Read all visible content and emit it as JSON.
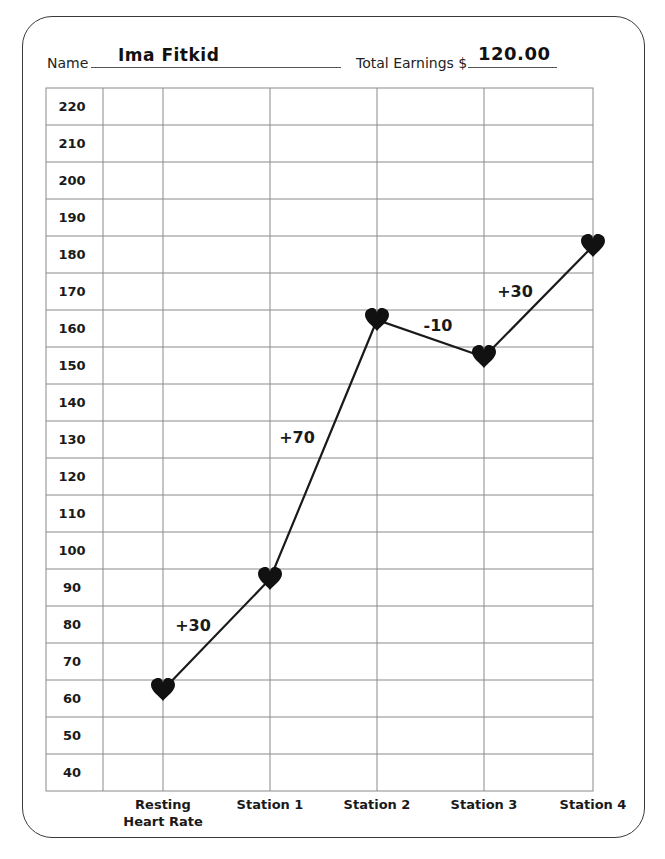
{
  "header": {
    "name_label": "Name",
    "name_value": "Ima Fitkid",
    "earnings_label": "Total Earnings $",
    "earnings_value": "120.00"
  },
  "colors": {
    "grid": "#8a8a8a",
    "line": "#1a1a1a",
    "marker": "#111111",
    "border": "#3a3a3a"
  },
  "chart_data": {
    "type": "line",
    "title": "",
    "xlabel": "",
    "ylabel": "",
    "categories": [
      "Resting Heart Rate",
      "Station 1",
      "Station 2",
      "Station 3",
      "Station 4"
    ],
    "category_lines": [
      [
        "Resting",
        "Heart Rate"
      ],
      [
        "Station 1"
      ],
      [
        "Station 2"
      ],
      [
        "Station 3"
      ],
      [
        "Station 4"
      ]
    ],
    "series": [
      {
        "name": "Heart Rate",
        "values": [
          60,
          90,
          160,
          150,
          180
        ],
        "marker": "heart-icon"
      }
    ],
    "annotations": [
      "+30",
      "+70",
      "-10",
      "+30"
    ],
    "y_ticks": [
      220,
      210,
      200,
      190,
      180,
      170,
      160,
      150,
      140,
      130,
      120,
      110,
      100,
      90,
      80,
      70,
      60,
      50,
      40
    ],
    "ylim": [
      40,
      220
    ],
    "grid": true,
    "legend": "none"
  }
}
